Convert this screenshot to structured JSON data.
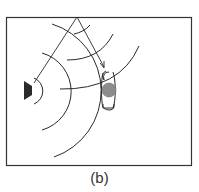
{
  "figure": {
    "caption": "(b)",
    "colors": {
      "line": "#2a2a2a",
      "frame": "#333333",
      "speaker": "#2b2b2b",
      "listener_head": "#8c8c8c"
    },
    "elements": {
      "source": "speaker",
      "receiver": "listener-head-with-ears",
      "ray_direct": "speaker to ceiling reflection point",
      "ray_reflected": "ceiling reflection point to listener (arrow)",
      "wavefront_count_from_source": 4,
      "wavefront_count_from_image_source": 3
    }
  }
}
